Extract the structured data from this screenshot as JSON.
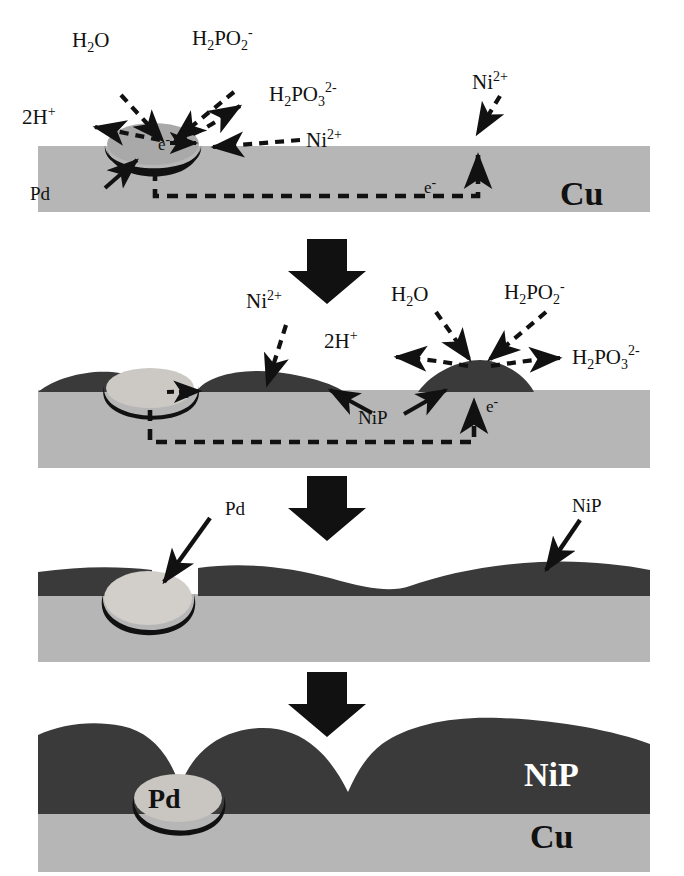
{
  "figure": {
    "colors": {
      "substrate_cu": "#b6b6b6",
      "deposit_nip": "#3a3a3a",
      "pd_particle": "#a9a9a9",
      "pd_outline": "#111111",
      "arrow_black": "#111111",
      "background": "#ffffff",
      "text": "#111111",
      "label_on_dark": "#ffffff"
    },
    "stage_count": 4,
    "transition_arrow_count": 3,
    "transition_arrow_icon": "down-block-arrow"
  },
  "stages": [
    {
      "id": "stage-1",
      "name": "pd-activation-initial-reaction",
      "substrate_label": "Cu",
      "pd_label": "Pd",
      "electron_label": "e⁻",
      "electron_path_label": "e⁻",
      "reactants": [
        "H₂O",
        "H₂PO₂⁻"
      ],
      "products": [
        "2H⁺",
        "H₂PO₃²⁻"
      ],
      "ion_labels": [
        "Ni²⁺",
        "Ni²⁺"
      ],
      "species": {
        "water": {
          "formula": "H",
          "sub1": "2",
          "rest": "O"
        },
        "hypophosphite": {
          "formula": "H",
          "sub1": "2",
          "mid": "PO",
          "sub2": "2",
          "charge": "-"
        },
        "phosphite": {
          "formula": "H",
          "sub1": "2",
          "mid": "PO",
          "sub2": "3",
          "charge": "2-"
        },
        "proton": {
          "prefix": "2H",
          "charge": "+"
        },
        "nickel": {
          "symbol": "Ni",
          "charge": "2+"
        }
      }
    },
    {
      "id": "stage-2",
      "name": "nip-nucleation-and-lateral-growth",
      "nip_label": "NiP",
      "electron_label": "e⁻",
      "electron_path_label": "e⁻",
      "reactants": [
        "H₂O",
        "H₂PO₂⁻"
      ],
      "products": [
        "2H⁺",
        "H₂PO₃²⁻"
      ],
      "ion_labels": [
        "Ni²⁺"
      ]
    },
    {
      "id": "stage-3",
      "name": "continuous-nip-film-coalescence",
      "pd_label": "Pd",
      "nip_label": "NiP"
    },
    {
      "id": "stage-4",
      "name": "thick-nip-overplate-with-buried-pd",
      "pd_label": "Pd",
      "nip_label": "NiP",
      "substrate_label": "Cu"
    }
  ]
}
